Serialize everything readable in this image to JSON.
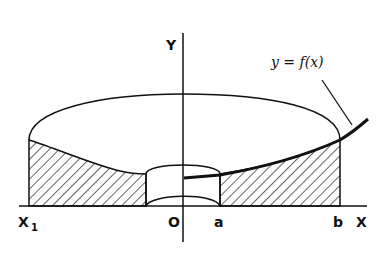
{
  "diagram": {
    "axes": {
      "x_label": "X",
      "y_label": "Y",
      "origin_label": "O"
    },
    "points": {
      "x1_label": "X",
      "x1_subscript": "1",
      "a_label": "a",
      "b_label": "b"
    },
    "curve_label": "y = f(x)",
    "colors": {
      "stroke": "#111111",
      "background": "#ffffff"
    }
  }
}
